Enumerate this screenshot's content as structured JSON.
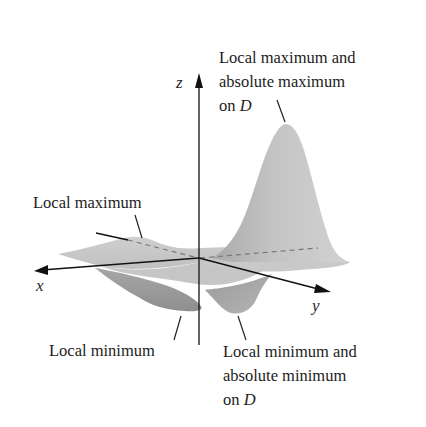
{
  "figure": {
    "type": "3d-surface-diagram",
    "surface_color": "#b8b8b8",
    "axes": {
      "x": "x",
      "y": "y",
      "z": "z"
    },
    "annotations": {
      "abs_max": {
        "line1": "Local maximum and",
        "line2": "absolute maximum",
        "line3_prefix": "on ",
        "line3_var": "D"
      },
      "local_max": {
        "line1": "Local maximum"
      },
      "local_min": {
        "line1": "Local minimum"
      },
      "abs_min": {
        "line1": "Local minimum and",
        "line2": "absolute minimum",
        "line3_prefix": "on ",
        "line3_var": "D"
      }
    }
  }
}
